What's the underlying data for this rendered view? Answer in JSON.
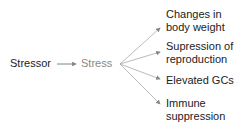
{
  "diagram": {
    "source": "Stressor",
    "middle": "Stress",
    "outcomes": [
      {
        "line1": "Changes in",
        "line2": "body weight"
      },
      {
        "line1": "Supression of",
        "line2": "reproduction"
      },
      {
        "line1": "Elevated GCs",
        "line2": ""
      },
      {
        "line1": "Immune",
        "line2": "suppression"
      }
    ],
    "colors": {
      "text": "#222222",
      "stress_text": "#888888",
      "arrow": "#999999"
    }
  }
}
